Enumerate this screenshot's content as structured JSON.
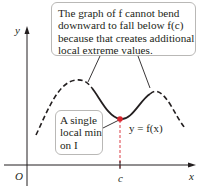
{
  "diagram": {
    "axes": {
      "x_label": "x",
      "y_label": "y",
      "origin_label": "O",
      "c_tick_label": "c"
    },
    "curve_label": "y = f(x)",
    "top_callout": {
      "lines": [
        "The graph of f cannot bend",
        "downward to fall below f(c)",
        "because that creates additional",
        "local extreme values."
      ]
    },
    "min_callout": {
      "lines": [
        "A single",
        "local min",
        "on I"
      ]
    },
    "colors": {
      "curve": "#231f20",
      "point": "#d7272f",
      "guide": "#d7272f",
      "axis": "#231f20",
      "callout_border": "#b9b8b6"
    }
  }
}
